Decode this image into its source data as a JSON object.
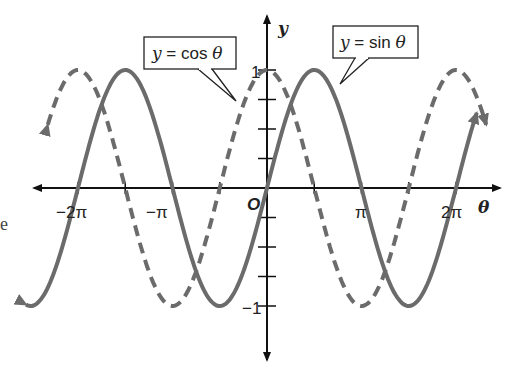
{
  "chart_data": {
    "type": "line",
    "title": "",
    "xlabel": "θ",
    "ylabel": "y",
    "xlim": [
      -7.2,
      7.2
    ],
    "ylim": [
      -1,
      1
    ],
    "x_ticks": [
      "−2π",
      "−π",
      "π",
      "2π"
    ],
    "y_ticks": [
      "1",
      "−1"
    ],
    "y_minor_tick_step": 0.25,
    "origin_label": "O",
    "grid": false,
    "series": [
      {
        "name": "y = sin θ",
        "function": "sin",
        "style": "solid",
        "color": "#6b6b6b"
      },
      {
        "name": "y = cos θ",
        "function": "cos",
        "style": "dashed",
        "color": "#6b6b6b"
      }
    ],
    "annotations": [
      {
        "text": "y = cos θ",
        "points_to": "cos curve near θ = −0.3"
      },
      {
        "text": "y = sin θ",
        "points_to": "sin curve near θ = 0.9π"
      }
    ]
  },
  "labels": {
    "x_axis": "θ",
    "y_axis": "y",
    "origin": "O",
    "tick_neg2pi": "−2π",
    "tick_negpi": "−π",
    "tick_pi": "π",
    "tick_2pi": "2π",
    "tick_y1": "1",
    "tick_yneg1": "−1",
    "cos_callout_y": "y",
    "cos_callout_rest": " = cos ",
    "cos_callout_theta": "θ",
    "sin_callout_y": "y",
    "sin_callout_rest": " = sin ",
    "sin_callout_theta": "θ",
    "side_fragment": "e"
  },
  "colors": {
    "curve": "#6b6b6b",
    "axis": "#111111"
  }
}
